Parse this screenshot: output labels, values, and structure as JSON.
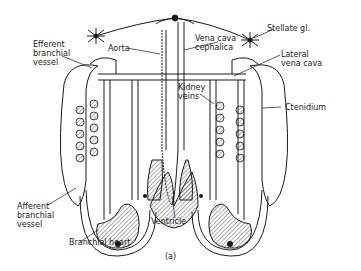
{
  "figure": {
    "panel_label": "(a)",
    "colors": {
      "line": "#1a1a1a",
      "background": "#ffffff",
      "hatch": "#6a6a6a"
    }
  },
  "labels": {
    "efferent_branchial_vessel": "Efferent\nbranchial\nvessel",
    "aorta": "Aorta",
    "vena_cava_cephalica": "Vena cava\ncephalica",
    "stellate_gl": "Stellate gl.",
    "lateral_vena_cava": "Lateral\nvena cava",
    "kidney_veins": "Kidney\nveins",
    "ctenidium": "Ctenidium",
    "afferent_branchial_vessel": "Afferent\nbranchial\nvessel",
    "branchial_heart": "Branchial heart",
    "ventricle": "Ventricle"
  }
}
